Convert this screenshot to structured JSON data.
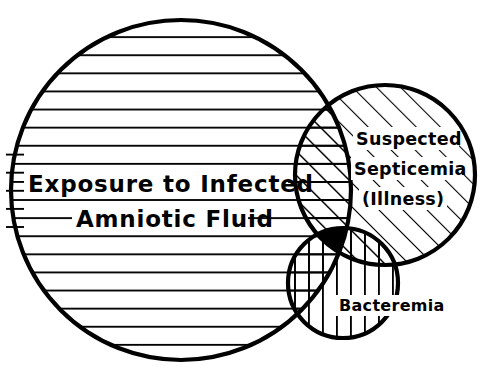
{
  "figure": {
    "kind": "venn-diagram",
    "background_color": "#ffffff",
    "stroke_color": "#000000",
    "title": ""
  },
  "sets": {
    "exposure": {
      "name": "exposure-set",
      "label_line1": "Exposure to Infected",
      "label_line2": "Amniotic Fluid",
      "fill_pattern": "horizontal-lines",
      "cx": 181,
      "cy": 190,
      "r": 170
    },
    "septicemia": {
      "name": "septicemia-set",
      "label_line1": "Suspected",
      "label_line2": "Septicemia",
      "label_line3": "(Illness)",
      "fill_pattern": "diagonal-lines",
      "cx": 385,
      "cy": 175,
      "r": 90
    },
    "bacteremia": {
      "name": "bacteremia-set",
      "label_line1": "Bacteremia",
      "fill_pattern": "vertical-lines",
      "cx": 343,
      "cy": 283,
      "r": 55
    }
  },
  "regions": {
    "exposure_septicemia": {
      "name": "exposure-and-septicemia",
      "fill_pattern": "cross-hatch-horizontal-diagonal"
    },
    "exposure_bacteremia": {
      "name": "exposure-and-bacteremia",
      "fill_pattern": "cross-hatch-horizontal-vertical"
    },
    "septicemia_bacteremia": {
      "name": "septicemia-and-bacteremia",
      "fill_pattern": "cross-hatch-diagonal-vertical"
    },
    "triple": {
      "name": "all-three-overlap",
      "fill_pattern": "solid",
      "fill_color": "#000000"
    }
  }
}
